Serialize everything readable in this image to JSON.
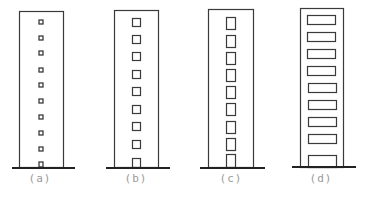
{
  "diagram": {
    "colors": {
      "line": "#3a3a3a",
      "ground": "#222222",
      "label": "#9a9a9a",
      "background": "#ffffff"
    },
    "buildings": [
      {
        "label": "(a)",
        "window_type": "small square",
        "window_count": 10
      },
      {
        "label": "(b)",
        "window_type": "medium square",
        "window_count": 9
      },
      {
        "label": "(c)",
        "window_type": "tall rectangle",
        "window_count": 9
      },
      {
        "label": "(d)",
        "window_type": "wide rectangle",
        "window_count": 9
      }
    ]
  }
}
